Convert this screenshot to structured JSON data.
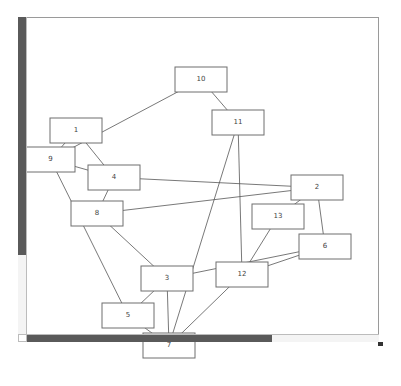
{
  "diagram": {
    "type": "graph",
    "nodes": [
      {
        "id": "1",
        "label": "1",
        "x": 50,
        "y": 118,
        "w": 52,
        "h": 25
      },
      {
        "id": "9",
        "label": "9",
        "x": 26,
        "y": 147,
        "w": 49,
        "h": 25
      },
      {
        "id": "10",
        "label": "10",
        "x": 175,
        "y": 67,
        "w": 52,
        "h": 25
      },
      {
        "id": "11",
        "label": "11",
        "x": 212,
        "y": 110,
        "w": 52,
        "h": 25
      },
      {
        "id": "4",
        "label": "4",
        "x": 88,
        "y": 165,
        "w": 52,
        "h": 25
      },
      {
        "id": "8",
        "label": "8",
        "x": 71,
        "y": 201,
        "w": 52,
        "h": 25
      },
      {
        "id": "2",
        "label": "2",
        "x": 291,
        "y": 175,
        "w": 52,
        "h": 25
      },
      {
        "id": "13",
        "label": "13",
        "x": 252,
        "y": 204,
        "w": 52,
        "h": 25
      },
      {
        "id": "6",
        "label": "6",
        "x": 299,
        "y": 234,
        "w": 52,
        "h": 25
      },
      {
        "id": "3",
        "label": "3",
        "x": 141,
        "y": 266,
        "w": 52,
        "h": 25
      },
      {
        "id": "12",
        "label": "12",
        "x": 216,
        "y": 262,
        "w": 52,
        "h": 25
      },
      {
        "id": "5",
        "label": "5",
        "x": 102,
        "y": 303,
        "w": 52,
        "h": 25
      },
      {
        "id": "7",
        "label": "7",
        "x": 143,
        "y": 333,
        "w": 52,
        "h": 25
      }
    ],
    "edges": [
      {
        "from": "10",
        "to": "9"
      },
      {
        "from": "10",
        "to": "11"
      },
      {
        "from": "1",
        "to": "9"
      },
      {
        "from": "1",
        "to": "4"
      },
      {
        "from": "9",
        "to": "4"
      },
      {
        "from": "9",
        "to": "5"
      },
      {
        "from": "4",
        "to": "2"
      },
      {
        "from": "4",
        "to": "8"
      },
      {
        "from": "8",
        "to": "2"
      },
      {
        "from": "8",
        "to": "3"
      },
      {
        "from": "11",
        "to": "7"
      },
      {
        "from": "11",
        "to": "12"
      },
      {
        "from": "2",
        "to": "13"
      },
      {
        "from": "2",
        "to": "6"
      },
      {
        "from": "13",
        "to": "12"
      },
      {
        "from": "6",
        "to": "3"
      },
      {
        "from": "6",
        "to": "12"
      },
      {
        "from": "3",
        "to": "7"
      },
      {
        "from": "3",
        "to": "5"
      },
      {
        "from": "12",
        "to": "7"
      },
      {
        "from": "5",
        "to": "7"
      }
    ]
  },
  "scrollbars": {
    "vertical": {
      "thumb_fraction": 0.75
    },
    "horizontal": {
      "thumb_fraction": 0.7
    }
  },
  "colors": {
    "edge": "#555555",
    "node_border": "#6e6e6e",
    "scroll_thumb": "#5a5a5a"
  }
}
